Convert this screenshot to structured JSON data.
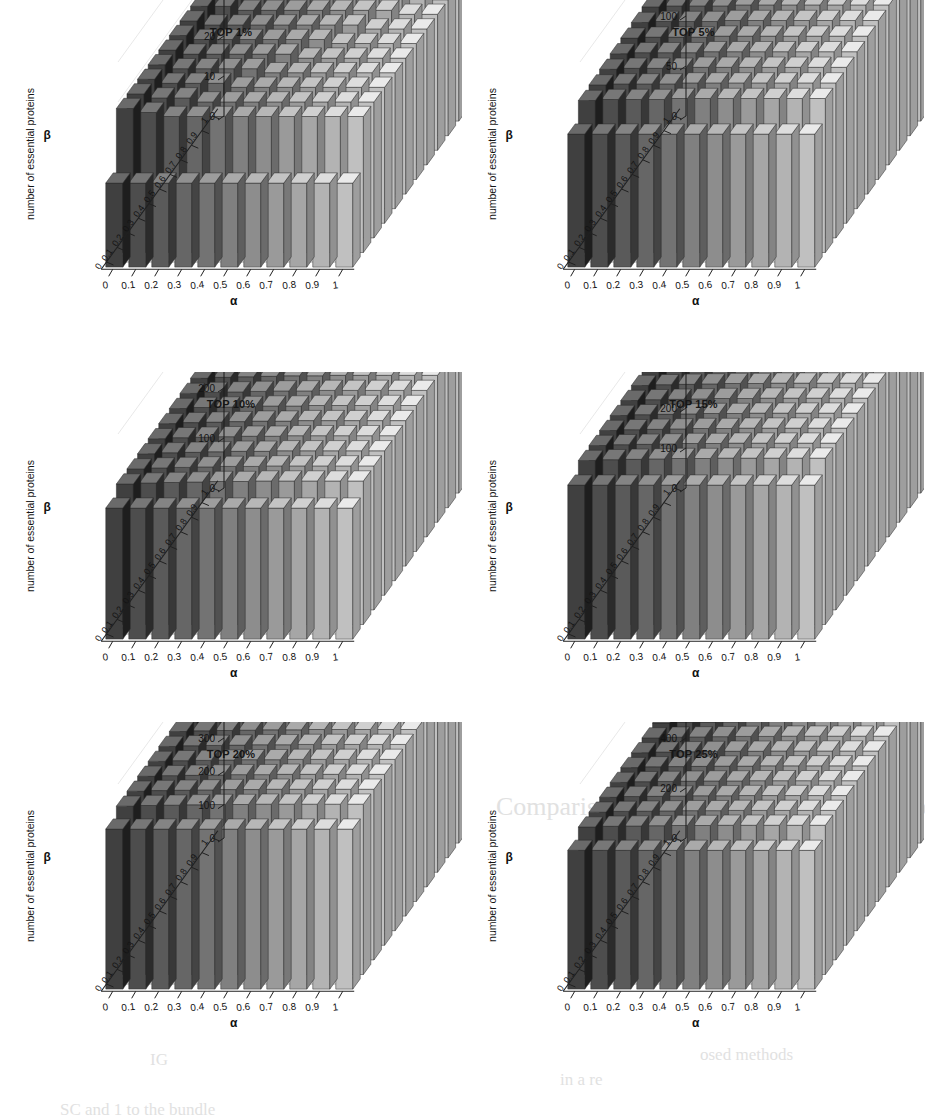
{
  "figure": {
    "axis_labels": {
      "y": "number of essential proteins",
      "x": "α",
      "z": "β"
    },
    "alpha_ticks": [
      "0",
      "0.1",
      "0.2",
      "0.3",
      "0.4",
      "0.5",
      "0.6",
      "0.7",
      "0.8",
      "0.9",
      "1"
    ],
    "beta_ticks": [
      "0",
      "0.1",
      "0.2",
      "0.3",
      "0.4",
      "0.5",
      "0.6",
      "0.7",
      "0.8",
      "0.9",
      "1"
    ]
  },
  "background_text": [
    {
      "text": "number of esse",
      "x": 330,
      "y": 372,
      "size": 19
    },
    {
      "text": "Comparison of ISO with PH other Methods",
      "x": 496,
      "y": 792,
      "size": 26
    },
    {
      "text": "of use",
      "x": 640,
      "y": 742,
      "size": 20
    },
    {
      "text": "IG",
      "x": 150,
      "y": 1050,
      "size": 17
    },
    {
      "text": "osed methods",
      "x": 700,
      "y": 1045,
      "size": 17
    },
    {
      "text": "in a re",
      "x": 560,
      "y": 1070,
      "size": 17
    },
    {
      "text": "SC and 1 to the bundle",
      "x": 60,
      "y": 1100,
      "size": 17
    }
  ],
  "chart_data": [
    {
      "type": "bar",
      "title": "TOP 1%",
      "xlabel": "α",
      "zlabel": "β",
      "ylabel": "number of essential proteins",
      "ylim": [
        0,
        50
      ],
      "yticks": [
        0,
        10,
        20,
        30,
        40,
        50
      ],
      "x": [
        "0",
        "0.1",
        "0.2",
        "0.3",
        "0.4",
        "0.5",
        "0.6",
        "0.7",
        "0.8",
        "0.9",
        "1"
      ],
      "z": [
        "0",
        "0.1",
        "0.2",
        "0.3",
        "0.4",
        "0.5",
        "0.6",
        "0.7",
        "0.8",
        "0.9",
        "1"
      ],
      "values": [
        [
          21,
          21,
          21,
          21,
          21,
          21,
          21,
          21,
          21,
          21,
          21
        ],
        [
          36,
          35,
          34,
          34,
          34,
          34,
          34,
          34,
          34,
          34,
          34
        ],
        [
          36,
          35,
          35,
          34,
          34,
          34,
          34,
          34,
          34,
          34,
          34
        ],
        [
          36,
          35,
          35,
          35,
          34,
          34,
          34,
          34,
          34,
          34,
          34
        ],
        [
          36,
          35,
          35,
          35,
          35,
          34,
          34,
          34,
          34,
          34,
          34
        ],
        [
          36,
          35,
          35,
          35,
          35,
          35,
          34,
          34,
          34,
          34,
          34
        ],
        [
          36,
          35,
          35,
          35,
          35,
          35,
          35,
          34,
          34,
          34,
          34
        ],
        [
          36,
          35,
          35,
          35,
          35,
          35,
          35,
          35,
          34,
          34,
          34
        ],
        [
          36,
          36,
          35,
          35,
          35,
          35,
          35,
          35,
          35,
          34,
          34
        ],
        [
          36,
          36,
          36,
          35,
          35,
          35,
          35,
          35,
          35,
          35,
          34
        ],
        [
          36,
          36,
          36,
          36,
          35,
          35,
          35,
          35,
          35,
          35,
          35
        ]
      ]
    },
    {
      "type": "bar",
      "title": "TOP 5%",
      "xlabel": "α",
      "zlabel": "β",
      "ylabel": "number of essential proteins",
      "ylim": [
        0,
        200
      ],
      "yticks": [
        0,
        50,
        100,
        150,
        200
      ],
      "x": [
        "0",
        "0.1",
        "0.2",
        "0.3",
        "0.4",
        "0.5",
        "0.6",
        "0.7",
        "0.8",
        "0.9",
        "1"
      ],
      "z": [
        "0",
        "0.1",
        "0.2",
        "0.3",
        "0.4",
        "0.5",
        "0.6",
        "0.7",
        "0.8",
        "0.9",
        "1"
      ],
      "values": [
        [
          133,
          133,
          133,
          133,
          133,
          133,
          133,
          133,
          133,
          133,
          133
        ],
        [
          152,
          153,
          153,
          153,
          154,
          154,
          154,
          154,
          154,
          154,
          154
        ],
        [
          153,
          154,
          154,
          154,
          155,
          155,
          155,
          155,
          155,
          155,
          155
        ],
        [
          154,
          155,
          155,
          155,
          156,
          156,
          156,
          156,
          156,
          156,
          156
        ],
        [
          155,
          156,
          156,
          156,
          157,
          157,
          157,
          157,
          157,
          157,
          157
        ],
        [
          156,
          157,
          157,
          157,
          158,
          158,
          158,
          158,
          158,
          158,
          158
        ],
        [
          157,
          158,
          158,
          158,
          159,
          159,
          159,
          159,
          159,
          159,
          159
        ],
        [
          158,
          159,
          159,
          159,
          160,
          160,
          160,
          160,
          160,
          160,
          160
        ],
        [
          159,
          160,
          160,
          160,
          161,
          161,
          161,
          161,
          161,
          161,
          161
        ],
        [
          160,
          161,
          161,
          161,
          162,
          162,
          162,
          162,
          162,
          162,
          162
        ],
        [
          161,
          162,
          162,
          162,
          163,
          163,
          163,
          163,
          163,
          163,
          163
        ]
      ]
    },
    {
      "type": "bar",
      "title": "TOP 10%",
      "xlabel": "α",
      "zlabel": "β",
      "ylabel": "number of essential proteins",
      "ylim": [
        0,
        400
      ],
      "yticks": [
        0,
        100,
        200,
        300,
        400
      ],
      "x": [
        "0",
        "0.1",
        "0.2",
        "0.3",
        "0.4",
        "0.5",
        "0.6",
        "0.7",
        "0.8",
        "0.9",
        "1"
      ],
      "z": [
        "0",
        "0.1",
        "0.2",
        "0.3",
        "0.4",
        "0.5",
        "0.6",
        "0.7",
        "0.8",
        "0.9",
        "1"
      ],
      "values": [
        [
          262,
          262,
          262,
          262,
          262,
          262,
          262,
          262,
          262,
          262,
          262
        ],
        [
          281,
          283,
          284,
          285,
          286,
          286,
          287,
          287,
          287,
          287,
          287
        ],
        [
          282,
          284,
          285,
          286,
          287,
          287,
          288,
          288,
          288,
          288,
          288
        ],
        [
          283,
          285,
          286,
          287,
          288,
          288,
          289,
          289,
          289,
          289,
          289
        ],
        [
          284,
          286,
          287,
          288,
          289,
          289,
          290,
          290,
          290,
          290,
          290
        ],
        [
          285,
          287,
          288,
          289,
          290,
          290,
          291,
          291,
          291,
          291,
          291
        ],
        [
          286,
          288,
          289,
          290,
          291,
          291,
          292,
          292,
          292,
          292,
          292
        ],
        [
          287,
          289,
          290,
          291,
          292,
          292,
          293,
          293,
          293,
          293,
          293
        ],
        [
          288,
          290,
          291,
          292,
          293,
          293,
          294,
          294,
          294,
          294,
          294
        ],
        [
          289,
          291,
          292,
          293,
          294,
          294,
          295,
          295,
          295,
          295,
          295
        ],
        [
          290,
          292,
          293,
          294,
          295,
          295,
          296,
          296,
          296,
          296,
          296
        ]
      ]
    },
    {
      "type": "bar",
      "title": "TOP 15%",
      "xlabel": "α",
      "zlabel": "β",
      "ylabel": "number of essential proteins",
      "ylim": [
        0,
        500
      ],
      "yticks": [
        0,
        100,
        200,
        300,
        400,
        500
      ],
      "x": [
        "0",
        "0.1",
        "0.2",
        "0.3",
        "0.4",
        "0.5",
        "0.6",
        "0.7",
        "0.8",
        "0.9",
        "1"
      ],
      "z": [
        "0",
        "0.1",
        "0.2",
        "0.3",
        "0.4",
        "0.5",
        "0.6",
        "0.7",
        "0.8",
        "0.9",
        "1"
      ],
      "values": [
        [
          385,
          385,
          385,
          385,
          385,
          385,
          385,
          385,
          385,
          385,
          385
        ],
        [
          410,
          412,
          413,
          414,
          415,
          415,
          416,
          416,
          416,
          416,
          416
        ],
        [
          411,
          413,
          414,
          415,
          416,
          416,
          417,
          417,
          417,
          417,
          417
        ],
        [
          412,
          414,
          415,
          416,
          417,
          417,
          418,
          418,
          418,
          418,
          418
        ],
        [
          413,
          415,
          416,
          417,
          418,
          418,
          419,
          419,
          419,
          419,
          419
        ],
        [
          414,
          416,
          417,
          418,
          419,
          419,
          420,
          420,
          420,
          420,
          420
        ],
        [
          415,
          417,
          418,
          419,
          420,
          420,
          421,
          421,
          421,
          421,
          421
        ],
        [
          416,
          418,
          419,
          420,
          421,
          421,
          422,
          422,
          422,
          422,
          422
        ],
        [
          417,
          419,
          420,
          421,
          422,
          422,
          423,
          423,
          423,
          423,
          423
        ],
        [
          418,
          420,
          421,
          422,
          423,
          423,
          424,
          424,
          424,
          424,
          424
        ],
        [
          419,
          421,
          422,
          423,
          424,
          424,
          425,
          425,
          425,
          425,
          425
        ]
      ]
    },
    {
      "type": "bar",
      "title": "TOP 20%",
      "xlabel": "α",
      "zlabel": "β",
      "ylabel": "number of essential proteins",
      "ylim": [
        0,
        600
      ],
      "yticks": [
        0,
        100,
        200,
        300,
        400,
        500,
        600
      ],
      "x": [
        "0",
        "0.1",
        "0.2",
        "0.3",
        "0.4",
        "0.5",
        "0.6",
        "0.7",
        "0.8",
        "0.9",
        "1"
      ],
      "z": [
        "0",
        "0.1",
        "0.2",
        "0.3",
        "0.4",
        "0.5",
        "0.6",
        "0.7",
        "0.8",
        "0.9",
        "1"
      ],
      "values": [
        [
          480,
          480,
          480,
          480,
          480,
          480,
          480,
          480,
          480,
          480,
          480
        ],
        [
          505,
          507,
          508,
          509,
          510,
          510,
          511,
          511,
          511,
          511,
          511
        ],
        [
          506,
          508,
          509,
          510,
          511,
          511,
          512,
          512,
          512,
          512,
          512
        ],
        [
          507,
          509,
          510,
          511,
          512,
          512,
          513,
          513,
          513,
          513,
          513
        ],
        [
          508,
          510,
          511,
          512,
          513,
          513,
          514,
          514,
          514,
          514,
          514
        ],
        [
          509,
          511,
          512,
          513,
          514,
          514,
          515,
          515,
          515,
          515,
          515
        ],
        [
          510,
          512,
          513,
          514,
          515,
          515,
          516,
          516,
          516,
          516,
          516
        ],
        [
          511,
          513,
          514,
          515,
          516,
          516,
          517,
          517,
          517,
          517,
          517
        ],
        [
          512,
          514,
          515,
          516,
          517,
          517,
          518,
          518,
          518,
          518,
          518
        ],
        [
          513,
          515,
          516,
          517,
          518,
          518,
          519,
          519,
          519,
          519,
          519
        ],
        [
          514,
          516,
          517,
          518,
          519,
          519,
          520,
          520,
          520,
          520,
          520
        ]
      ]
    },
    {
      "type": "bar",
      "title": "TOP 25%",
      "xlabel": "α",
      "zlabel": "β",
      "ylabel": "number of essential proteins",
      "ylim": [
        0,
        800
      ],
      "yticks": [
        0,
        200,
        400,
        600,
        800
      ],
      "x": [
        "0",
        "0.1",
        "0.2",
        "0.3",
        "0.4",
        "0.5",
        "0.6",
        "0.7",
        "0.8",
        "0.9",
        "1"
      ],
      "z": [
        "0",
        "0.1",
        "0.2",
        "0.3",
        "0.4",
        "0.5",
        "0.6",
        "0.7",
        "0.8",
        "0.9",
        "1"
      ],
      "values": [
        [
          555,
          555,
          555,
          555,
          555,
          555,
          555,
          555,
          555,
          555,
          555
        ],
        [
          590,
          593,
          594,
          595,
          596,
          596,
          597,
          597,
          597,
          597,
          597
        ],
        [
          591,
          594,
          595,
          596,
          597,
          597,
          598,
          598,
          598,
          598,
          598
        ],
        [
          592,
          595,
          596,
          597,
          598,
          598,
          599,
          599,
          599,
          599,
          599
        ],
        [
          593,
          596,
          597,
          598,
          599,
          599,
          600,
          600,
          600,
          600,
          600
        ],
        [
          594,
          597,
          598,
          599,
          600,
          600,
          601,
          601,
          601,
          601,
          601
        ],
        [
          595,
          598,
          599,
          600,
          601,
          601,
          602,
          602,
          602,
          602,
          602
        ],
        [
          596,
          599,
          600,
          601,
          602,
          602,
          603,
          603,
          603,
          603,
          603
        ],
        [
          597,
          600,
          601,
          602,
          603,
          603,
          604,
          604,
          604,
          604,
          604
        ],
        [
          598,
          601,
          602,
          603,
          604,
          604,
          605,
          605,
          605,
          605,
          605
        ],
        [
          599,
          602,
          603,
          604,
          605,
          605,
          606,
          606,
          606,
          606,
          606
        ]
      ]
    }
  ]
}
